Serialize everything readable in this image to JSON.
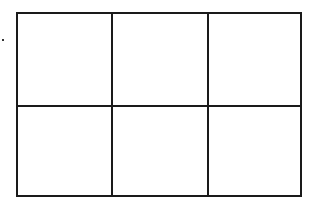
{
  "diagram": {
    "type": "grid",
    "rows": 2,
    "columns": 3,
    "line_color": "#1a1a1a",
    "background_color": "#ffffff",
    "cells": [
      {
        "row": 0,
        "col": 0,
        "text": ""
      },
      {
        "row": 0,
        "col": 1,
        "text": ""
      },
      {
        "row": 0,
        "col": 2,
        "text": ""
      },
      {
        "row": 1,
        "col": 0,
        "text": ""
      },
      {
        "row": 1,
        "col": 1,
        "text": ""
      },
      {
        "row": 1,
        "col": 2,
        "text": ""
      }
    ]
  }
}
